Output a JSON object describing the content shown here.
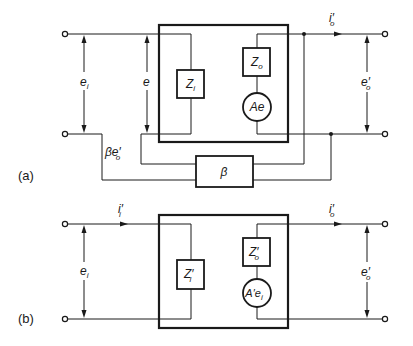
{
  "diagram": {
    "type": "feedback amplifier equivalent circuits",
    "part_a": {
      "label": "(a)",
      "input_voltage": {
        "main": "e",
        "sub": "i"
      },
      "internal_voltage": {
        "main": "e",
        "sub": ""
      },
      "feedback_voltage": {
        "prefix": "βe",
        "prime": "′",
        "sub": "o"
      },
      "input_impedance": {
        "main": "Z",
        "sub": "i"
      },
      "output_impedance": {
        "main": "Z",
        "sub": "o"
      },
      "source": "Ae",
      "output_current": {
        "main": "i",
        "prime": "′",
        "sub": "o"
      },
      "output_voltage": {
        "main": "e",
        "prime": "′",
        "sub": "o"
      },
      "feedback_block": "β"
    },
    "part_b": {
      "label": "(b)",
      "input_current": {
        "main": "i",
        "prime": "′",
        "sub": "i"
      },
      "input_voltage": {
        "main": "e",
        "sub": "i"
      },
      "input_impedance": {
        "main": "Z",
        "prime": "′",
        "sub": "i"
      },
      "output_impedance": {
        "main": "Z",
        "prime": "′",
        "sub": "o"
      },
      "source": {
        "main": "A′e",
        "sub": "i"
      },
      "output_current": {
        "main": "i",
        "prime": "′",
        "sub": "o"
      },
      "output_voltage": {
        "main": "e",
        "prime": "′",
        "sub": "o"
      }
    }
  }
}
